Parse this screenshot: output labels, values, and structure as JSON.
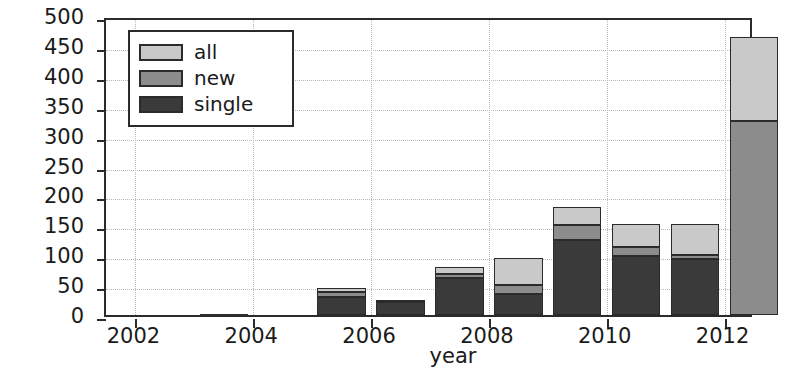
{
  "chart_data": {
    "type": "bar",
    "subtype": "stacked",
    "title": "",
    "xlabel": "year",
    "ylabel": "number",
    "xlim": [
      2001.5,
      2012.5
    ],
    "ylim": [
      0,
      500
    ],
    "ytick_labels": [
      "0",
      "50",
      "100",
      "150",
      "200",
      "250",
      "300",
      "350",
      "400",
      "450",
      "500"
    ],
    "ytick_values": [
      0,
      50,
      100,
      150,
      200,
      250,
      300,
      350,
      400,
      450,
      500
    ],
    "xtick_labels": [
      "2002",
      "2004",
      "2006",
      "2008",
      "2010",
      "2012"
    ],
    "xtick_values": [
      2002,
      2004,
      2006,
      2008,
      2010,
      2012
    ],
    "grid": true,
    "legend_position": "upper left",
    "categories": [
      2002,
      2003,
      2004,
      2005,
      2006,
      2007,
      2008,
      2009,
      2010,
      2011,
      2012
    ],
    "series": [
      {
        "name": "single",
        "color": "#3a3a3a",
        "values": [
          0,
          2,
          0,
          30,
          22,
          62,
          35,
          125,
          98,
          93,
          0
        ]
      },
      {
        "name": "new",
        "color": "#8c8c8c",
        "values": [
          0,
          0,
          0,
          8,
          2,
          6,
          15,
          25,
          15,
          7,
          325
        ]
      },
      {
        "name": "all",
        "color": "#c9c9c9",
        "values": [
          0,
          0,
          0,
          7,
          1,
          12,
          45,
          30,
          40,
          53,
          140
        ]
      }
    ],
    "totals": [
      0,
      2,
      0,
      45,
      25,
      80,
      95,
      180,
      153,
      153,
      465
    ]
  },
  "legend": {
    "entries": [
      {
        "label": "all",
        "color": "#c9c9c9"
      },
      {
        "label": "new",
        "color": "#8c8c8c"
      },
      {
        "label": "single",
        "color": "#3a3a3a"
      }
    ]
  },
  "axes": {
    "x_title": "year",
    "y_title": "number"
  }
}
